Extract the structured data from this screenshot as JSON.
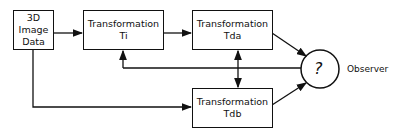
{
  "diagram": {
    "nodes": [
      {
        "id": "data",
        "lines": [
          "3D",
          "Image",
          "Data"
        ]
      },
      {
        "id": "ti",
        "lines": [
          "Transformation",
          "Ti"
        ]
      },
      {
        "id": "tda",
        "lines": [
          "Transformation",
          "Tda"
        ]
      },
      {
        "id": "tdb",
        "lines": [
          "Transformation",
          "Tdb"
        ]
      },
      {
        "id": "observer",
        "symbol": "?",
        "label": "Observer"
      }
    ],
    "edges": [
      {
        "from": "data",
        "to": "ti"
      },
      {
        "from": "ti",
        "to": "tda"
      },
      {
        "from": "tda",
        "to": "observer"
      },
      {
        "from": "data",
        "to": "tdb"
      },
      {
        "from": "tdb",
        "to": "observer"
      },
      {
        "from": "observer",
        "to": "ti",
        "type": "feedback"
      },
      {
        "from": "observer",
        "to": "tda",
        "type": "feedback"
      },
      {
        "from": "observer",
        "to": "tdb",
        "type": "feedback"
      }
    ]
  }
}
